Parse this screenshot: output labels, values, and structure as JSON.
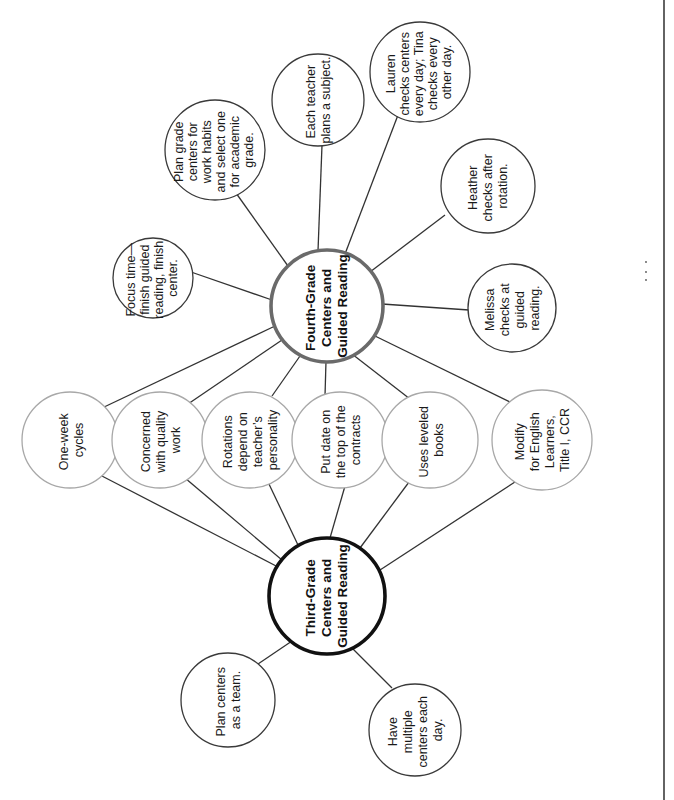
{
  "diagram": {
    "orientation": "rotated-90-counterclockwise",
    "colors": {
      "third_grade_hub_stroke": "#111111",
      "fourth_grade_hub_stroke": "#6a6a6a",
      "shared_circle_stroke": "#a8a8a8",
      "outer_circle_stroke": "#3a3a3a",
      "edge": "#333333"
    },
    "hubs": {
      "third_grade": {
        "lines": [
          "Third-Grade",
          "Centers and",
          "Guided Reading"
        ]
      },
      "fourth_grade": {
        "lines": [
          "Fourth-Grade",
          "Centers and",
          "Guided Reading"
        ]
      }
    },
    "shared": [
      {
        "lines": [
          "One-week",
          "cycles"
        ]
      },
      {
        "lines": [
          "Concerned",
          "with quality",
          "work"
        ]
      },
      {
        "lines": [
          "Rotations",
          "depend on",
          "teacher’s",
          "personality"
        ]
      },
      {
        "lines": [
          "Put date on",
          "the top of the",
          "contracts"
        ]
      },
      {
        "lines": [
          "Uses leveled",
          "books"
        ]
      },
      {
        "lines": [
          "Modify",
          "for English",
          "Learners,",
          "Title I, CCR"
        ]
      }
    ],
    "third_grade_only": [
      {
        "lines": [
          "Plan centers",
          "as a team."
        ]
      },
      {
        "lines": [
          "Have",
          "multiple",
          "centers each",
          "day."
        ]
      }
    ],
    "fourth_grade_only": [
      {
        "lines": [
          "Focus time—",
          "finish guided",
          "reading, finish",
          "center."
        ]
      },
      {
        "lines": [
          "Plan grade",
          "centers for",
          "work habits",
          "and select one",
          "for academic",
          "grade."
        ]
      },
      {
        "lines": [
          "Each teacher",
          "plans a subject."
        ]
      },
      {
        "lines": [
          "Lauren",
          "checks centers",
          "every day; Tina",
          "checks every",
          "other day."
        ]
      },
      {
        "lines": [
          "Heather",
          "checks after",
          "rotation."
        ]
      },
      {
        "lines": [
          "Melissa",
          "checks at",
          "guided",
          "reading."
        ]
      }
    ]
  }
}
